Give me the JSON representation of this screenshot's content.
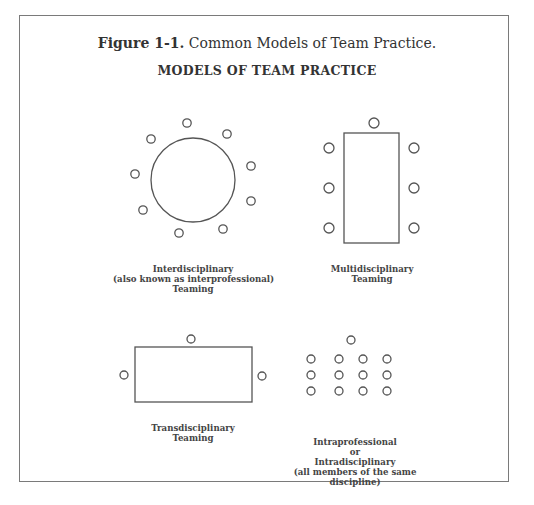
{
  "figure": {
    "number": "Figure 1-1.",
    "caption": " Common Models of Team Practice.",
    "title": "MODELS OF TEAM PRACTICE"
  },
  "models": [
    {
      "id": "interdisciplinary",
      "lines": [
        "Interdisciplinary",
        "(also known as interprofessional)",
        "Teaming"
      ]
    },
    {
      "id": "multidisciplinary",
      "lines": [
        "Multidisciplinary",
        "Teaming"
      ]
    },
    {
      "id": "transdisciplinary",
      "lines": [
        "Transdisciplinary",
        "Teaming"
      ]
    },
    {
      "id": "intraprofessional",
      "lines": [
        "Intraprofessional",
        "or",
        "Intradisciplinary",
        "(all members of the same",
        "discipline)"
      ]
    }
  ],
  "colors": {
    "stroke": "#555555",
    "frame": "#7a7a7a"
  }
}
